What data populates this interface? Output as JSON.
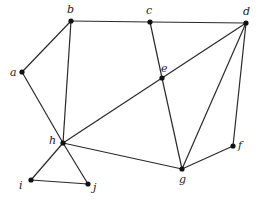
{
  "diagram": {
    "type": "undirected-graph",
    "nodes": [
      {
        "id": "a",
        "label": "a",
        "x": 22,
        "y": 72,
        "lx": 10,
        "ly": 76
      },
      {
        "id": "b",
        "label": "b",
        "x": 71,
        "y": 21,
        "lx": 67,
        "ly": 13
      },
      {
        "id": "c",
        "label": "c",
        "x": 150,
        "y": 22,
        "lx": 146,
        "ly": 14
      },
      {
        "id": "d",
        "label": "d",
        "x": 246,
        "y": 23,
        "lx": 243,
        "ly": 15
      },
      {
        "id": "e",
        "label": "e",
        "x": 162,
        "y": 78,
        "lx": 161,
        "ly": 72
      },
      {
        "id": "f",
        "label": "f",
        "x": 233,
        "y": 146,
        "lx": 238,
        "ly": 149
      },
      {
        "id": "g",
        "label": "g",
        "x": 182,
        "y": 169,
        "lx": 179,
        "ly": 183
      },
      {
        "id": "h",
        "label": "h",
        "x": 63,
        "y": 143,
        "lx": 49,
        "ly": 144
      },
      {
        "id": "i",
        "label": "i",
        "x": 31,
        "y": 180,
        "lx": 19,
        "ly": 189
      },
      {
        "id": "j",
        "label": "j",
        "x": 88,
        "y": 184,
        "lx": 93,
        "ly": 191
      }
    ],
    "edges": [
      [
        "a",
        "b"
      ],
      [
        "a",
        "h"
      ],
      [
        "b",
        "c"
      ],
      [
        "c",
        "d"
      ],
      [
        "b",
        "h"
      ],
      [
        "c",
        "e"
      ],
      [
        "e",
        "g"
      ],
      [
        "d",
        "e"
      ],
      [
        "e",
        "h"
      ],
      [
        "d",
        "g"
      ],
      [
        "d",
        "f"
      ],
      [
        "f",
        "g"
      ],
      [
        "h",
        "g"
      ],
      [
        "h",
        "i"
      ],
      [
        "h",
        "j"
      ],
      [
        "i",
        "j"
      ]
    ]
  }
}
